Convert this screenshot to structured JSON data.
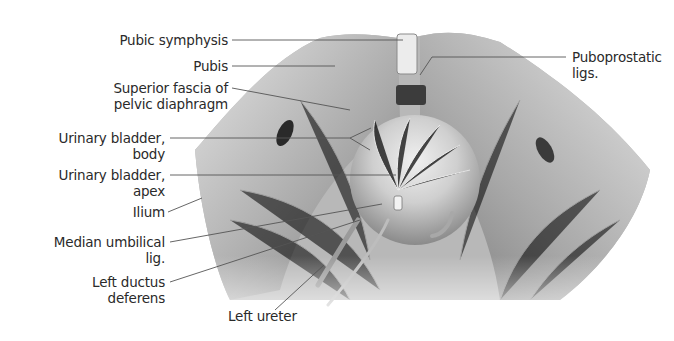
{
  "figure": {
    "colors": {
      "background": "#ffffff",
      "bone_light": "#d9d9d9",
      "bone_mid": "#a9a9a9",
      "muscle_dark": "#6e6e6e",
      "bladder": "#c8c8c8",
      "leader_line": "#555555",
      "text": "#2a2a2a"
    },
    "labels": [
      {
        "id": "pubic-symphysis",
        "lines": [
          "Pubic symphysis"
        ]
      },
      {
        "id": "pubis",
        "lines": [
          "Pubis"
        ]
      },
      {
        "id": "superior-fascia",
        "lines": [
          "Superior fascia of",
          "pelvic diaphragm"
        ]
      },
      {
        "id": "bladder-body",
        "lines": [
          "Urinary bladder,",
          "body"
        ]
      },
      {
        "id": "bladder-apex",
        "lines": [
          "Urinary bladder,",
          "apex"
        ]
      },
      {
        "id": "ilium",
        "lines": [
          "Ilium"
        ]
      },
      {
        "id": "median-umbilical",
        "lines": [
          "Median umbilical",
          "lig."
        ]
      },
      {
        "id": "left-ductus",
        "lines": [
          "Left ductus",
          "deferens"
        ]
      },
      {
        "id": "left-ureter",
        "lines": [
          "Left ureter"
        ]
      },
      {
        "id": "puboprostatic",
        "lines": [
          "Puboprostatic",
          "ligs."
        ]
      }
    ]
  }
}
